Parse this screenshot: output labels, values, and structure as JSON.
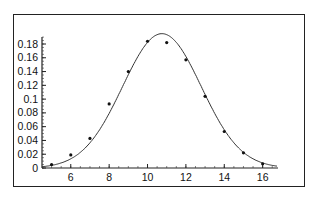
{
  "chart_data": {
    "type": "line",
    "title": "",
    "xlabel": "",
    "ylabel": "",
    "xlim": [
      4.5,
      16.8
    ],
    "ylim": [
      0,
      0.19
    ],
    "grid": false,
    "legend": null,
    "x_ticks": [
      6,
      8,
      10,
      12,
      14,
      16
    ],
    "y_ticks": [
      0,
      0.02,
      0.04,
      0.06,
      0.08,
      0.1,
      0.12,
      0.14,
      0.16,
      0.18
    ],
    "x_tick_labels": [
      "6",
      "8",
      "10",
      "12",
      "14",
      "16"
    ],
    "y_tick_labels": [
      "0",
      "0.02",
      "0.04",
      "0.06",
      "0.08",
      "0.1",
      "0.12",
      "0.14",
      "0.16",
      "0.18"
    ],
    "series": [
      {
        "name": "observed",
        "style": "points",
        "x": [
          5,
          6,
          7,
          8,
          9,
          10,
          11,
          12,
          13,
          14,
          15,
          16
        ],
        "values": [
          0.005,
          0.019,
          0.043,
          0.093,
          0.14,
          0.184,
          0.182,
          0.157,
          0.104,
          0.053,
          0.022,
          0.006
        ]
      },
      {
        "name": "fitted normal curve",
        "style": "line",
        "mean": 10.75,
        "sd": 2.05,
        "peak": 0.195
      }
    ]
  }
}
